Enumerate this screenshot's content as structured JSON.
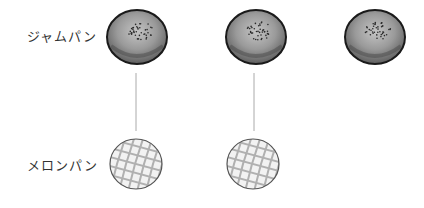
{
  "rows": [
    {
      "label": "ジャムパン",
      "kind": "jam-bun",
      "count": 3
    },
    {
      "label": "メロンパン",
      "kind": "melon-bun",
      "count": 2
    }
  ],
  "connections": [
    {
      "from": "jam-bun-1",
      "to": "melon-bun-1"
    },
    {
      "from": "jam-bun-2",
      "to": "melon-bun-2"
    }
  ],
  "colors": {
    "jam_outline": "#1a1a1a",
    "jam_fill": "#8a8a8a",
    "melon_outline": "#555555",
    "melon_fill": "#f2f2f2",
    "melon_grid": "#b0b0b0",
    "line": "#aaaaaa"
  }
}
